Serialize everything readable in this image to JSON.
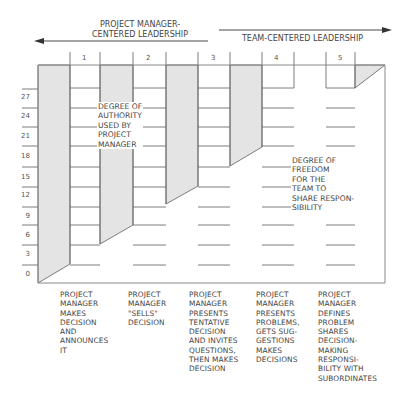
{
  "header": {
    "left_label": "PROJECT MANAGER-\nCENTERED LEADERSHIP",
    "right_label": "TEAM-CENTERED LEADERSHIP"
  },
  "columns": [
    "1",
    "2",
    "3",
    "4",
    "5"
  ],
  "y_axis": [
    "27",
    "24",
    "21",
    "18",
    "15",
    "12",
    "9",
    "6",
    "3",
    "0"
  ],
  "regions": {
    "authority": "DEGREE OF\nAUTHORITY\nUSED BY\nPROJECT\nMANAGER",
    "freedom": "DEGREE OF\nFREEDOM\nFOR THE\nTEAM TO\nSHARE RESPON-\nSIBILITY"
  },
  "styles": [
    {
      "number": "1",
      "description": "PROJECT\nMANAGER\nMAKES\nDECISION\nAND\nANNOUNCES\nIT"
    },
    {
      "number": "2",
      "description": "PROJECT\nMANAGER\n\"SELLS\"\nDECISION"
    },
    {
      "number": "3",
      "description": "PROJECT\nMANAGER\nPRESENTS\nTENTATIVE\nDECISION\nAND INVITES\nQUESTIONS,\nTHEN MAKES\nDECISION"
    },
    {
      "number": "4",
      "description": "PROJECT\nMANAGER\nPRESENTS\nPROBLEMS,\nGETS SUG-\nGESTIONS\nMAKES\nDECISIONS"
    },
    {
      "number": "5",
      "description": "PROJECT\nMANAGER\nDEFINES\nPROBLEM\nSHARES\nDECISION-\nMAKING\nRESPONSI-\nBILITY WITH\nSUBORDINATES"
    }
  ],
  "colors": {
    "shade": "#e4e4e4",
    "line": "#6e6e6e",
    "frame": "#8a8a8a"
  }
}
